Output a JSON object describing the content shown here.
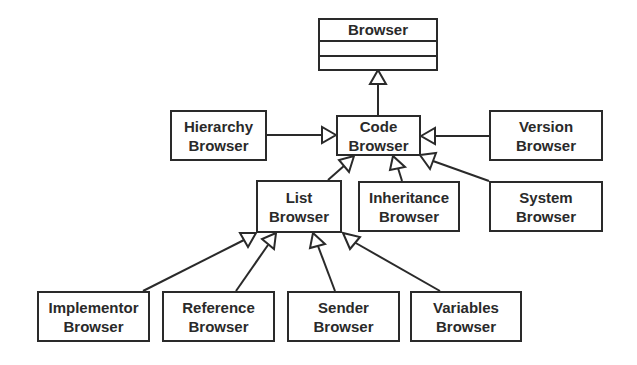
{
  "diagram": {
    "type": "uml-class-hierarchy",
    "colors": {
      "line": "#2a2a2a",
      "background": "#ffffff"
    },
    "root": {
      "id": "browser",
      "label": "Browser",
      "compartments": 3
    },
    "nodes": [
      {
        "id": "code",
        "line1": "Code",
        "line2": "Browser"
      },
      {
        "id": "hierarchy",
        "line1": "Hierarchy",
        "line2": "Browser"
      },
      {
        "id": "version",
        "line1": "Version",
        "line2": "Browser"
      },
      {
        "id": "list",
        "line1": "List",
        "line2": "Browser"
      },
      {
        "id": "inheritance",
        "line1": "Inheritance",
        "line2": "Browser"
      },
      {
        "id": "system",
        "line1": "System",
        "line2": "Browser"
      },
      {
        "id": "implementor",
        "line1": "Implementor",
        "line2": "Browser"
      },
      {
        "id": "reference",
        "line1": "Reference",
        "line2": "Browser"
      },
      {
        "id": "sender",
        "line1": "Sender",
        "line2": "Browser"
      },
      {
        "id": "variables",
        "line1": "Variables",
        "line2": "Browser"
      }
    ],
    "edges": [
      {
        "from": "code",
        "to": "browser",
        "kind": "generalization"
      },
      {
        "from": "hierarchy",
        "to": "code",
        "kind": "generalization"
      },
      {
        "from": "version",
        "to": "code",
        "kind": "generalization"
      },
      {
        "from": "list",
        "to": "code",
        "kind": "generalization"
      },
      {
        "from": "inheritance",
        "to": "code",
        "kind": "generalization"
      },
      {
        "from": "system",
        "to": "code",
        "kind": "generalization"
      },
      {
        "from": "implementor",
        "to": "list",
        "kind": "generalization"
      },
      {
        "from": "reference",
        "to": "list",
        "kind": "generalization"
      },
      {
        "from": "sender",
        "to": "list",
        "kind": "generalization"
      },
      {
        "from": "variables",
        "to": "list",
        "kind": "generalization"
      }
    ]
  }
}
